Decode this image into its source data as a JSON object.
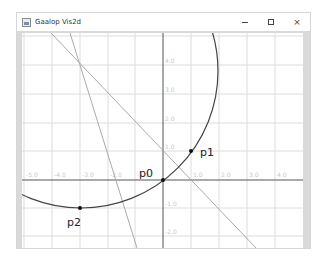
{
  "window": {
    "title": "Gaalop Vis2d",
    "controls": {
      "minimize": "minimize",
      "maximize": "maximize",
      "close": "×"
    }
  },
  "plot": {
    "x_tick_labels": [
      "-5.0",
      "-4.0",
      "-3.0",
      "-2.0",
      "-1.0",
      "1.0",
      "2.0",
      "3.0",
      "4.0"
    ],
    "y_tick_labels": [
      "4.0",
      "3.0",
      "2.0",
      "1.0",
      "-1.0",
      "-2.0"
    ],
    "points": [
      {
        "label": "p0",
        "x": 0,
        "y": 0
      },
      {
        "label": "p1",
        "x": 1,
        "y": 1
      },
      {
        "label": "p2",
        "x": -3,
        "y": -1
      }
    ],
    "colors": {
      "grid": "#dcdcdc",
      "axis": "#555555",
      "circle": "#444444",
      "lines": "#aaaaaa",
      "points": "#111111"
    }
  }
}
